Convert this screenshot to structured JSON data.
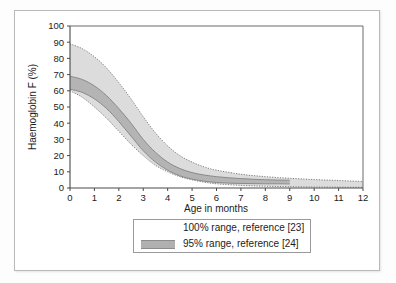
{
  "chart_data": {
    "type": "area",
    "title": "",
    "xlabel": "Age in months",
    "ylabel": "Haemoglobin F (%)",
    "xlim": [
      0,
      12
    ],
    "ylim": [
      0,
      100
    ],
    "xticks": [
      "0",
      "1",
      "2",
      "3",
      "4",
      "5",
      "6",
      "7",
      "8",
      "9",
      "10",
      "11",
      "12"
    ],
    "yticks": [
      "0",
      "10",
      "20",
      "30",
      "40",
      "50",
      "60",
      "70",
      "80",
      "90",
      "100"
    ],
    "grid": false,
    "legend_position": "below-axis",
    "series": [
      {
        "name": "100% range, reference [23]",
        "style": "dotted-outline-shaded-band",
        "fill_color": "#dcdcdc",
        "line_color": "#8f8f8f",
        "x": [
          0,
          0.5,
          1,
          1.5,
          2,
          2.5,
          3,
          3.5,
          4,
          4.5,
          5,
          5.5,
          6,
          7,
          8,
          9,
          10,
          11,
          12
        ],
        "upper": [
          89,
          86,
          81,
          74,
          65,
          55,
          44,
          34,
          26,
          20,
          16,
          13,
          11,
          8.5,
          7,
          6,
          5.2,
          4.6,
          4
        ],
        "lower": [
          60,
          56,
          50,
          43,
          35,
          27,
          20,
          14,
          10,
          7,
          5,
          3.6,
          2.6,
          1.6,
          1.1,
          0.8,
          0.6,
          0.5,
          0.4
        ]
      },
      {
        "name": "95% range, reference [24]",
        "style": "solid-shaded-band",
        "fill_color": "#b4b4b4",
        "line_color": "#8a8a8a",
        "x": [
          0,
          0.5,
          1,
          1.5,
          2,
          2.5,
          3,
          3.5,
          4,
          4.5,
          5,
          5.5,
          6,
          6.5,
          7,
          7.5,
          8,
          8.5,
          9
        ],
        "upper": [
          69,
          67,
          63,
          57,
          49,
          40,
          30,
          22,
          16,
          12,
          9.5,
          8,
          7,
          6.3,
          5.8,
          5.4,
          5.1,
          4.9,
          4.8
        ],
        "lower": [
          61,
          59,
          55,
          49,
          41,
          32,
          23,
          16,
          11,
          7.5,
          5.5,
          4.2,
          3.4,
          3,
          2.8,
          2.7,
          2.6,
          2.6,
          2.5
        ]
      }
    ],
    "notes": {
      "series_95_ends_at": "9",
      "series_100_ends_at": "12"
    }
  },
  "axis": {
    "x_title": "Age in months",
    "y_title": "Haemoglobin F (%)"
  },
  "legend": {
    "entries": [
      {
        "label": "100% range, reference [23]",
        "swatch": "dotted-band-swatch"
      },
      {
        "label": "95% range, reference [24]",
        "swatch": "solid-grey-band-swatch"
      }
    ]
  }
}
